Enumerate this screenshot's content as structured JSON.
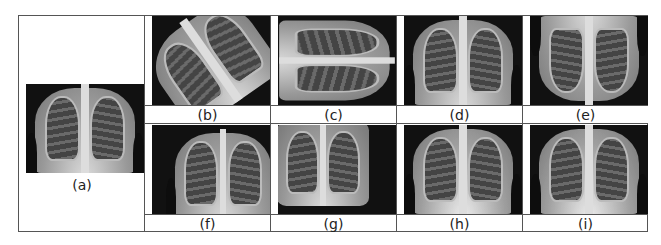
{
  "figure": {
    "panels": [
      {
        "id": "a",
        "label": "(a)",
        "description": "original chest x-ray"
      },
      {
        "id": "b",
        "label": "(b)",
        "description": "rotated chest x-ray"
      },
      {
        "id": "c",
        "label": "(c)",
        "description": "rotated 90 degrees chest x-ray"
      },
      {
        "id": "d",
        "label": "(d)",
        "description": "horizontally flipped chest x-ray"
      },
      {
        "id": "e",
        "label": "(e)",
        "description": "vertically flipped chest x-ray"
      },
      {
        "id": "f",
        "label": "(f)",
        "description": "shifted chest x-ray"
      },
      {
        "id": "g",
        "label": "(g)",
        "description": "shifted/zoomed chest x-ray"
      },
      {
        "id": "h",
        "label": "(h)",
        "description": "noise-added chest x-ray"
      },
      {
        "id": "i",
        "label": "(i)",
        "description": "noise-added chest x-ray"
      }
    ]
  }
}
